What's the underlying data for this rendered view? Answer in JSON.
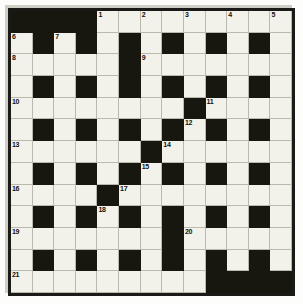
{
  "puzzle": {
    "title": "Crossword Grid",
    "rows": 13,
    "cols": 13,
    "colors": {
      "block": "#17170f",
      "cell": "#f2f1ea",
      "gridline": "#b9b9ad",
      "border": "#1a1a18",
      "number": "#111110"
    },
    "grid": [
      [
        "B",
        "B",
        "B",
        "B",
        "W",
        "W",
        "W",
        "W",
        "W",
        "W",
        "W",
        "W",
        "W"
      ],
      [
        "W",
        "B",
        "W",
        "B",
        "W",
        "B",
        "W",
        "B",
        "W",
        "B",
        "W",
        "B",
        "W"
      ],
      [
        "W",
        "W",
        "W",
        "W",
        "W",
        "B",
        "W",
        "W",
        "W",
        "W",
        "W",
        "W",
        "W"
      ],
      [
        "W",
        "B",
        "W",
        "B",
        "W",
        "B",
        "W",
        "B",
        "W",
        "B",
        "W",
        "B",
        "W"
      ],
      [
        "W",
        "W",
        "W",
        "W",
        "W",
        "W",
        "W",
        "W",
        "B",
        "W",
        "W",
        "W",
        "W"
      ],
      [
        "W",
        "B",
        "W",
        "B",
        "W",
        "B",
        "W",
        "B",
        "W",
        "B",
        "W",
        "B",
        "W"
      ],
      [
        "W",
        "W",
        "W",
        "W",
        "W",
        "W",
        "B",
        "W",
        "W",
        "W",
        "W",
        "W",
        "W"
      ],
      [
        "W",
        "B",
        "W",
        "B",
        "W",
        "B",
        "W",
        "B",
        "W",
        "B",
        "W",
        "B",
        "W"
      ],
      [
        "W",
        "W",
        "W",
        "W",
        "B",
        "W",
        "W",
        "W",
        "W",
        "W",
        "W",
        "W",
        "W"
      ],
      [
        "W",
        "B",
        "W",
        "B",
        "W",
        "B",
        "W",
        "B",
        "W",
        "B",
        "W",
        "B",
        "W"
      ],
      [
        "W",
        "W",
        "W",
        "W",
        "W",
        "W",
        "W",
        "B",
        "W",
        "W",
        "W",
        "W",
        "W"
      ],
      [
        "W",
        "B",
        "W",
        "B",
        "W",
        "B",
        "W",
        "B",
        "W",
        "B",
        "W",
        "B",
        "W"
      ],
      [
        "W",
        "W",
        "W",
        "W",
        "W",
        "W",
        "W",
        "W",
        "W",
        "B",
        "B",
        "B",
        "B"
      ]
    ],
    "numbers": [
      {
        "row": 0,
        "col": 4,
        "label": "1"
      },
      {
        "row": 0,
        "col": 6,
        "label": "2"
      },
      {
        "row": 0,
        "col": 8,
        "label": "3"
      },
      {
        "row": 0,
        "col": 10,
        "label": "4"
      },
      {
        "row": 0,
        "col": 12,
        "label": "5"
      },
      {
        "row": 1,
        "col": 0,
        "label": "6"
      },
      {
        "row": 1,
        "col": 2,
        "label": "7"
      },
      {
        "row": 2,
        "col": 0,
        "label": "8"
      },
      {
        "row": 2,
        "col": 6,
        "label": "9"
      },
      {
        "row": 4,
        "col": 0,
        "label": "10"
      },
      {
        "row": 4,
        "col": 9,
        "label": "11"
      },
      {
        "row": 5,
        "col": 8,
        "label": "12"
      },
      {
        "row": 6,
        "col": 0,
        "label": "13"
      },
      {
        "row": 6,
        "col": 7,
        "label": "14"
      },
      {
        "row": 7,
        "col": 6,
        "label": "15"
      },
      {
        "row": 8,
        "col": 0,
        "label": "16"
      },
      {
        "row": 8,
        "col": 5,
        "label": "17"
      },
      {
        "row": 9,
        "col": 4,
        "label": "18"
      },
      {
        "row": 10,
        "col": 0,
        "label": "19"
      },
      {
        "row": 10,
        "col": 8,
        "label": "20"
      },
      {
        "row": 12,
        "col": 0,
        "label": "21"
      }
    ]
  }
}
